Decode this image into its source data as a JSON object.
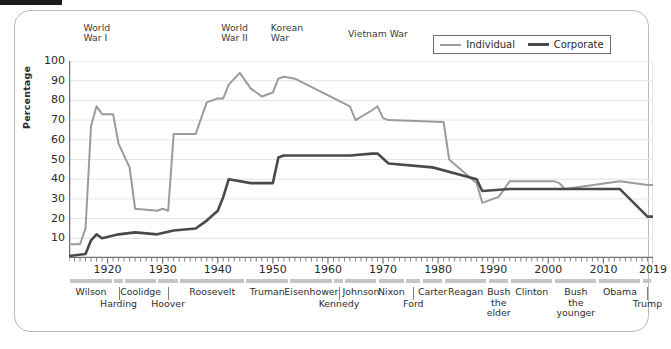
{
  "chart_data": {
    "type": "line",
    "title": "",
    "xlabel": "",
    "ylabel": "Percentage",
    "ylim": [
      0,
      100
    ],
    "xlim": [
      1913,
      2019
    ],
    "yticks": [
      10,
      20,
      30,
      40,
      50,
      60,
      70,
      80,
      90,
      100
    ],
    "xticks": [
      1920,
      1930,
      1940,
      1950,
      1960,
      1970,
      1980,
      1990,
      2000,
      2010,
      2019
    ],
    "grid": true,
    "legend_position": "top-right",
    "legend": [
      "Individual",
      "Corporate"
    ],
    "colors": {
      "individual": "#9b9b9b",
      "corporate": "#4a4a4a",
      "grid": "#e2e4e6",
      "axis": "#707375"
    },
    "series": [
      {
        "name": "Individual",
        "x": [
          1913,
          1915,
          1916,
          1917,
          1918,
          1919,
          1921,
          1922,
          1924,
          1925,
          1929,
          1930,
          1931,
          1932,
          1936,
          1938,
          1940,
          1941,
          1942,
          1944,
          1946,
          1948,
          1950,
          1951,
          1952,
          1954,
          1964,
          1965,
          1968,
          1969,
          1970,
          1971,
          1981,
          1982,
          1987,
          1988,
          1991,
          1993,
          2001,
          2002,
          2003,
          2013,
          2018,
          2019
        ],
        "values": [
          7,
          7,
          15,
          67,
          77,
          73,
          73,
          58,
          46,
          25,
          24,
          25,
          24,
          63,
          63,
          79,
          81,
          81,
          88,
          94,
          86,
          82,
          84,
          91,
          92,
          91,
          77,
          70,
          75,
          77,
          71,
          70,
          69,
          50,
          38,
          28,
          31,
          39,
          39,
          38,
          35,
          39,
          37,
          37
        ]
      },
      {
        "name": "Corporate",
        "x": [
          1913,
          1916,
          1917,
          1918,
          1919,
          1922,
          1925,
          1929,
          1932,
          1936,
          1938,
          1940,
          1941,
          1942,
          1946,
          1950,
          1951,
          1952,
          1964,
          1968,
          1969,
          1971,
          1979,
          1987,
          1988,
          1993,
          2001,
          2013,
          2018,
          2019
        ],
        "values": [
          1,
          2,
          9,
          12,
          10,
          12,
          13,
          12,
          14,
          15,
          19,
          24,
          31,
          40,
          38,
          38,
          51,
          52,
          52,
          53,
          53,
          48,
          46,
          40,
          34,
          35,
          35,
          35,
          21,
          21
        ]
      }
    ],
    "annotations": [
      {
        "label": "World\nWar I",
        "x": 1916
      },
      {
        "label": "World\nWar II",
        "x": 1941
      },
      {
        "label": "Korean\nWar",
        "x": 1950
      },
      {
        "label": "Vietnam War",
        "x": 1964
      }
    ]
  },
  "legend": {
    "individual_label": "Individual",
    "corporate_label": "Corporate"
  },
  "axes": {
    "y_title": "Percentage",
    "y_ticks": [
      "100",
      "90",
      "80",
      "70",
      "60",
      "50",
      "40",
      "30",
      "20",
      "10"
    ],
    "x_ticks": [
      "1920",
      "1930",
      "1940",
      "1950",
      "1960",
      "1970",
      "1980",
      "1990",
      "2000",
      "2010",
      "2019"
    ]
  },
  "annotations": {
    "ww1_line1": "World",
    "ww1_line2": "War I",
    "ww2_line1": "World",
    "ww2_line2": "War II",
    "korea_line1": "Korean",
    "korea_line2": "War",
    "vietnam": "Vietnam War"
  },
  "presidents": [
    {
      "name": "Wilson",
      "start": 1913,
      "end": 1921,
      "row": 0
    },
    {
      "name": "Harding",
      "start": 1921,
      "end": 1923,
      "row": 1
    },
    {
      "name": "Coolidge",
      "start": 1923,
      "end": 1929,
      "row": 0
    },
    {
      "name": "Hoover",
      "start": 1929,
      "end": 1933,
      "row": 1
    },
    {
      "name": "Roosevelt",
      "start": 1933,
      "end": 1945,
      "row": 0
    },
    {
      "name": "Truman",
      "start": 1945,
      "end": 1953,
      "row": 0
    },
    {
      "name": "Eisenhower",
      "start": 1953,
      "end": 1961,
      "row": 0
    },
    {
      "name": "Kennedy",
      "start": 1961,
      "end": 1963,
      "row": 1
    },
    {
      "name": "Johnson",
      "start": 1963,
      "end": 1969,
      "row": 0
    },
    {
      "name": "Nixon",
      "start": 1969,
      "end": 1974,
      "row": 0
    },
    {
      "name": "Ford",
      "start": 1974,
      "end": 1977,
      "row": 1
    },
    {
      "name": "Carter",
      "start": 1977,
      "end": 1981,
      "row": 0
    },
    {
      "name": "Reagan",
      "start": 1981,
      "end": 1989,
      "row": 0
    },
    {
      "name": "Bush\nthe\nelder",
      "start": 1989,
      "end": 1993,
      "row": 0
    },
    {
      "name": "Clinton",
      "start": 1993,
      "end": 2001,
      "row": 0
    },
    {
      "name": "Bush\nthe\nyounger",
      "start": 2001,
      "end": 2009,
      "row": 0
    },
    {
      "name": "Obama",
      "start": 2009,
      "end": 2017,
      "row": 0
    },
    {
      "name": "Trump",
      "start": 2017,
      "end": 2019,
      "row": 1
    }
  ]
}
